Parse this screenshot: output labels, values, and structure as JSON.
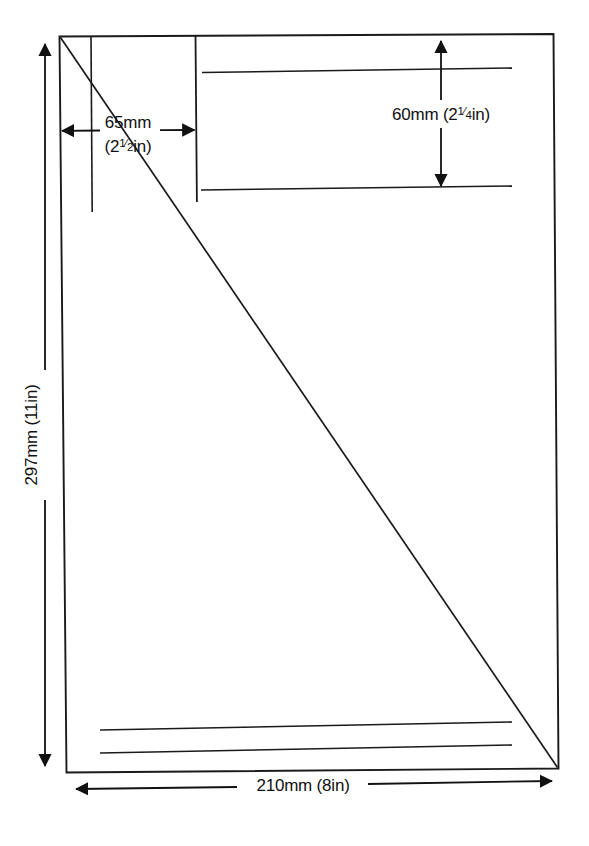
{
  "diagram": {
    "type": "technical-line-drawing",
    "background_color": "#ffffff",
    "line_color": "#1a1a1a",
    "sheet": {
      "name": "A4 paper sheet outline",
      "width_label": "210mm (8in)",
      "height_label": "297mm (11in)"
    },
    "dimensions": {
      "width": {
        "id": "sheet-width",
        "text": "210mm (8in)",
        "value_mm": 210,
        "value_in": 8,
        "orientation": "horizontal",
        "position": "bottom"
      },
      "height": {
        "id": "sheet-height",
        "text": "297mm (11in)",
        "value_mm": 297,
        "value_in": 11,
        "orientation": "vertical",
        "position": "left"
      },
      "margin": {
        "id": "left-margin",
        "text_line1": "65mm",
        "text_line2_prefix": "(2",
        "text_line2_fraction_num": "1",
        "text_line2_fraction_den": "2",
        "text_line2_suffix": "in)",
        "full_text": "65mm (2½in)",
        "value_mm": 65,
        "value_in": 2.5,
        "orientation": "horizontal",
        "position": "top-left"
      },
      "band": {
        "id": "top-band-height",
        "text_prefix": "60mm (2",
        "text_fraction_num": "1",
        "text_fraction_den": "4",
        "text_suffix": "in)",
        "full_text": "60mm (2¼in)",
        "value_mm": 60,
        "value_in": 2.25,
        "orientation": "vertical",
        "position": "top-right"
      }
    },
    "guides": [
      {
        "name": "short-vertical-guide",
        "orientation": "vertical"
      },
      {
        "name": "long-vertical-guide",
        "orientation": "vertical"
      },
      {
        "name": "upper-horizontal-rule",
        "orientation": "horizontal"
      },
      {
        "name": "lower-horizontal-rule",
        "orientation": "horizontal"
      },
      {
        "name": "bottom-rule-one",
        "orientation": "horizontal"
      },
      {
        "name": "bottom-rule-two",
        "orientation": "horizontal"
      },
      {
        "name": "corner-diagonal",
        "orientation": "diagonal"
      }
    ]
  }
}
